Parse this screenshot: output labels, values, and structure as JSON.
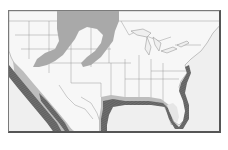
{
  "map": {
    "region": "United States and Mexico",
    "colors": {
      "background": "#f2f2f2",
      "land": "#f4f4f4",
      "ocean": "#eeeeee",
      "borders": "#8c8c8c",
      "frame": "#6e6e6e",
      "zone_light": "#a8a8a8",
      "zone_dark": "#6a6a6a",
      "zone_halo": "#bdbdbd"
    },
    "zones": [
      {
        "id": "inland",
        "shade": "light gray",
        "description": "Northern Great Plains and Great Basin region"
      },
      {
        "id": "coastal",
        "shade": "dark gray hatched",
        "description": "Pacific coast of Mexico, Gulf of Mexico coast, Florida and Southeast Atlantic coast"
      }
    ]
  }
}
